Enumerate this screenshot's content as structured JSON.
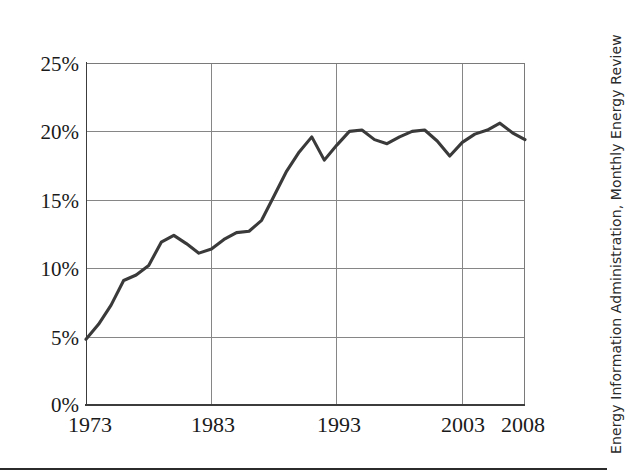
{
  "chart_data": {
    "type": "line",
    "title": "",
    "subtitle": "",
    "xlabel": "",
    "ylabel": "",
    "xlim": [
      1973,
      2008
    ],
    "ylim": [
      0,
      25
    ],
    "grid": true,
    "legend": false,
    "legend_position": "none",
    "y_tick_labels": [
      "0%",
      "5%",
      "10%",
      "15%",
      "20%",
      "25%"
    ],
    "y_tick_values": [
      0,
      5,
      10,
      15,
      20,
      25
    ],
    "x_tick_labels": [
      "1973",
      "1983",
      "1993",
      "2003",
      "2008"
    ],
    "x_tick_values": [
      1973,
      1983,
      1993,
      2003,
      2008
    ],
    "x": [
      1973,
      1974,
      1975,
      1976,
      1977,
      1978,
      1979,
      1980,
      1981,
      1982,
      1983,
      1984,
      1985,
      1986,
      1987,
      1988,
      1989,
      1990,
      1991,
      1992,
      1993,
      1994,
      1995,
      1996,
      1997,
      1998,
      1999,
      2000,
      2001,
      2002,
      2003,
      2004,
      2005,
      2006,
      2007,
      2008
    ],
    "values": [
      4.8,
      5.9,
      7.3,
      9.1,
      9.5,
      10.2,
      11.9,
      12.4,
      11.8,
      11.1,
      11.4,
      12.1,
      12.6,
      12.7,
      13.5,
      15.3,
      17.1,
      18.5,
      19.6,
      17.9,
      19.0,
      20.0,
      20.1,
      19.4,
      19.1,
      19.6,
      20.0,
      20.1,
      19.3,
      18.2,
      19.2,
      19.8,
      20.1,
      20.6,
      19.9,
      19.4
    ],
    "series": [
      {
        "name": "Share",
        "values": [
          4.8,
          5.9,
          7.3,
          9.1,
          9.5,
          10.2,
          11.9,
          12.4,
          11.8,
          11.1,
          11.4,
          12.1,
          12.6,
          12.7,
          13.5,
          15.3,
          17.1,
          18.5,
          19.6,
          17.9,
          19.0,
          20.0,
          20.1,
          19.4,
          19.1,
          19.6,
          20.0,
          20.1,
          19.3,
          18.2,
          19.2,
          19.8,
          20.1,
          20.6,
          19.9,
          19.4
        ],
        "color": "#3a3a3a"
      }
    ],
    "units": "percent",
    "annotations": []
  },
  "source": {
    "text": "Energy Information Administration, Monthly Energy Review"
  },
  "colors": {
    "line": "#3a3a3a",
    "grid": "#868686",
    "axis": "#3c3c3c",
    "text": "#1a1a1a",
    "background": "#ffffff"
  },
  "geometry": {
    "plot_left": 86,
    "plot_right": 525,
    "plot_top": 63,
    "plot_bottom": 405
  }
}
